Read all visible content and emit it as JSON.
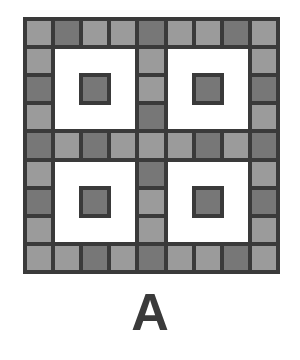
{
  "figure": {
    "label": "A",
    "grid_size": 9,
    "colors": {
      "border": "#3a3a3a",
      "light": "#9b9b9b",
      "dark": "#777777",
      "empty": "#ffffff"
    },
    "cells": [
      [
        "L",
        "D",
        "L",
        "L",
        "D",
        "L",
        "L",
        "D",
        "L"
      ],
      [
        "L",
        "W",
        "W",
        "W",
        "L",
        "W",
        "W",
        "W",
        "L"
      ],
      [
        "D",
        "W",
        "D",
        "W",
        "L",
        "W",
        "D",
        "W",
        "D"
      ],
      [
        "L",
        "W",
        "W",
        "W",
        "D",
        "W",
        "W",
        "W",
        "L"
      ],
      [
        "D",
        "L",
        "D",
        "L",
        "L",
        "L",
        "D",
        "L",
        "D"
      ],
      [
        "L",
        "W",
        "W",
        "W",
        "D",
        "W",
        "W",
        "W",
        "L"
      ],
      [
        "D",
        "W",
        "D",
        "W",
        "L",
        "W",
        "D",
        "W",
        "D"
      ],
      [
        "L",
        "W",
        "W",
        "W",
        "L",
        "W",
        "W",
        "W",
        "L"
      ],
      [
        "L",
        "L",
        "D",
        "L",
        "D",
        "L",
        "L",
        "D",
        "L"
      ]
    ]
  }
}
